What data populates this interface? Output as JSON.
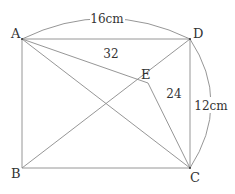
{
  "figure": {
    "points": {
      "A": {
        "label": "A"
      },
      "B": {
        "label": "B"
      },
      "C": {
        "label": "C"
      },
      "D": {
        "label": "D"
      },
      "E": {
        "label": "E"
      }
    },
    "segments": [
      "AB",
      "BC",
      "CD",
      "DA",
      "AC",
      "BD",
      "AE",
      "EC"
    ],
    "dimensions": {
      "AD": "16cm",
      "DC": "12cm"
    },
    "region_values": {
      "triangle_AED": "32",
      "triangle_DEC": "24"
    },
    "colors": {
      "line": "#8a8a8a",
      "text": "#333333",
      "background": "#ffffff"
    }
  }
}
